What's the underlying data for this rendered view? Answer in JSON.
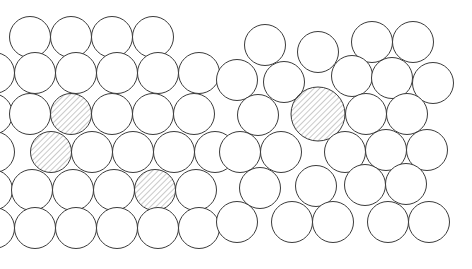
{
  "figure": {
    "background_color": "#ffffff",
    "width": 472,
    "height": 269,
    "atom_outline_color": "#3b3b3b",
    "atom_fill_color": "#ffffff",
    "impurity_hatch_color": "#7a7a7a",
    "impurity_hatch_angle_deg": 45,
    "atom_outline_width": 1
  },
  "panels": [
    {
      "id": "left-panel",
      "name": "equal-size-substitutional-panel",
      "description": "Regular close-packed lattice with three equal-sized substitutional impurity atoms",
      "host_radius": 20.5,
      "impurity_radius": 20.5,
      "atoms": [
        {
          "cx": 30,
          "cy": 37,
          "r": 20.5,
          "type": "host"
        },
        {
          "cx": 71,
          "cy": 37,
          "r": 20.5,
          "type": "host"
        },
        {
          "cx": 112,
          "cy": 37,
          "r": 20.5,
          "type": "host"
        },
        {
          "cx": 153,
          "cy": 37,
          "r": 20.5,
          "type": "host"
        },
        {
          "cx": -6,
          "cy": 73,
          "r": 20.5,
          "type": "host"
        },
        {
          "cx": 35,
          "cy": 73,
          "r": 20.5,
          "type": "host"
        },
        {
          "cx": 76,
          "cy": 73,
          "r": 20.5,
          "type": "host"
        },
        {
          "cx": 117,
          "cy": 73,
          "r": 20.5,
          "type": "host"
        },
        {
          "cx": 158,
          "cy": 73,
          "r": 20.5,
          "type": "host"
        },
        {
          "cx": 199,
          "cy": 73,
          "r": 20.5,
          "type": "host"
        },
        {
          "cx": -8,
          "cy": 114,
          "r": 20.5,
          "type": "host"
        },
        {
          "cx": 30,
          "cy": 114,
          "r": 20.5,
          "type": "host"
        },
        {
          "cx": 71,
          "cy": 114,
          "r": 20.5,
          "type": "impurity"
        },
        {
          "cx": 112,
          "cy": 114,
          "r": 20.5,
          "type": "host"
        },
        {
          "cx": 153,
          "cy": 114,
          "r": 20.5,
          "type": "host"
        },
        {
          "cx": 194,
          "cy": 114,
          "r": 20.5,
          "type": "host"
        },
        {
          "cx": -6,
          "cy": 152,
          "r": 20.5,
          "type": "host"
        },
        {
          "cx": 51,
          "cy": 152,
          "r": 20.5,
          "type": "impurity"
        },
        {
          "cx": 92,
          "cy": 152,
          "r": 20.5,
          "type": "host"
        },
        {
          "cx": 133,
          "cy": 152,
          "r": 20.5,
          "type": "host"
        },
        {
          "cx": 174,
          "cy": 152,
          "r": 20.5,
          "type": "host"
        },
        {
          "cx": 215,
          "cy": 152,
          "r": 20.5,
          "type": "host"
        },
        {
          "cx": -8,
          "cy": 190,
          "r": 20.5,
          "type": "host"
        },
        {
          "cx": 32,
          "cy": 190,
          "r": 20.5,
          "type": "host"
        },
        {
          "cx": 73,
          "cy": 190,
          "r": 20.5,
          "type": "host"
        },
        {
          "cx": 114,
          "cy": 190,
          "r": 20.5,
          "type": "host"
        },
        {
          "cx": 155,
          "cy": 190,
          "r": 20.5,
          "type": "impurity"
        },
        {
          "cx": 196,
          "cy": 190,
          "r": 20.5,
          "type": "host"
        },
        {
          "cx": -6,
          "cy": 228,
          "r": 20.5,
          "type": "host"
        },
        {
          "cx": 35,
          "cy": 228,
          "r": 20.5,
          "type": "host"
        },
        {
          "cx": 76,
          "cy": 228,
          "r": 20.5,
          "type": "host"
        },
        {
          "cx": 117,
          "cy": 228,
          "r": 20.5,
          "type": "host"
        },
        {
          "cx": 158,
          "cy": 228,
          "r": 20.5,
          "type": "host"
        },
        {
          "cx": 199,
          "cy": 228,
          "r": 20.5,
          "type": "host"
        }
      ]
    },
    {
      "id": "right-panel",
      "name": "oversized-substitutional-panel",
      "description": "Distorted close-packed lattice with one oversized substitutional impurity atom",
      "host_radius": 20.5,
      "impurity_radius": 27,
      "atoms": [
        {
          "cx": 265,
          "cy": 45,
          "r": 20.5,
          "type": "host"
        },
        {
          "cx": 318,
          "cy": 52,
          "r": 20.5,
          "type": "host"
        },
        {
          "cx": 372,
          "cy": 42,
          "r": 20.5,
          "type": "host"
        },
        {
          "cx": 413,
          "cy": 42,
          "r": 20.5,
          "type": "host"
        },
        {
          "cx": 237,
          "cy": 80,
          "r": 20.5,
          "type": "host"
        },
        {
          "cx": 284,
          "cy": 82,
          "r": 20.5,
          "type": "host"
        },
        {
          "cx": 352,
          "cy": 76,
          "r": 20.5,
          "type": "host"
        },
        {
          "cx": 392,
          "cy": 78,
          "r": 20.5,
          "type": "host"
        },
        {
          "cx": 433,
          "cy": 83,
          "r": 20.5,
          "type": "host"
        },
        {
          "cx": 318,
          "cy": 114,
          "r": 27,
          "type": "impurity"
        },
        {
          "cx": 258,
          "cy": 115,
          "r": 20.5,
          "type": "host"
        },
        {
          "cx": 366,
          "cy": 114,
          "r": 20.5,
          "type": "host"
        },
        {
          "cx": 407,
          "cy": 114,
          "r": 20.5,
          "type": "host"
        },
        {
          "cx": 240,
          "cy": 152,
          "r": 20.5,
          "type": "host"
        },
        {
          "cx": 281,
          "cy": 152,
          "r": 20.5,
          "type": "host"
        },
        {
          "cx": 345,
          "cy": 152,
          "r": 20.5,
          "type": "host"
        },
        {
          "cx": 386,
          "cy": 150,
          "r": 20.5,
          "type": "host"
        },
        {
          "cx": 427,
          "cy": 150,
          "r": 20.5,
          "type": "host"
        },
        {
          "cx": 260,
          "cy": 188,
          "r": 20.5,
          "type": "host"
        },
        {
          "cx": 316,
          "cy": 186,
          "r": 20.5,
          "type": "host"
        },
        {
          "cx": 365,
          "cy": 185,
          "r": 20.5,
          "type": "host"
        },
        {
          "cx": 406,
          "cy": 184,
          "r": 20.5,
          "type": "host"
        },
        {
          "cx": 237,
          "cy": 222,
          "r": 20.5,
          "type": "host"
        },
        {
          "cx": 292,
          "cy": 222,
          "r": 20.5,
          "type": "host"
        },
        {
          "cx": 333,
          "cy": 222,
          "r": 20.5,
          "type": "host"
        },
        {
          "cx": 388,
          "cy": 222,
          "r": 20.5,
          "type": "host"
        },
        {
          "cx": 429,
          "cy": 222,
          "r": 20.5,
          "type": "host"
        }
      ]
    }
  ]
}
